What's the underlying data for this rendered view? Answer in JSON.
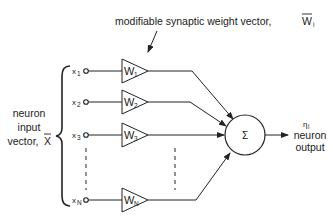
{
  "diagram": {
    "title": "modifiable synaptic weight vector,",
    "title_vector_symbol": "W",
    "title_vector_subscript": "i",
    "input_label": {
      "line1": "neuron",
      "line2": "input",
      "line3": "vector,",
      "vector_symbol": "X"
    },
    "inputs": [
      {
        "symbol": "x",
        "subscript": "1",
        "weight": "W",
        "weight_subscript": "1"
      },
      {
        "symbol": "x",
        "subscript": "2",
        "weight": "W",
        "weight_subscript": "2"
      },
      {
        "symbol": "x",
        "subscript": "3",
        "weight": "W",
        "weight_subscript": "3"
      },
      {
        "symbol": "x",
        "subscript": "N",
        "weight": "W",
        "weight_subscript": "N"
      }
    ],
    "summation_symbol": "Σ",
    "output_symbol": "η",
    "output_subscript": "i",
    "output_label": {
      "line1": "neuron",
      "line2": "output"
    },
    "colors": {
      "stroke": "#222222",
      "background": "#ffffff"
    }
  }
}
